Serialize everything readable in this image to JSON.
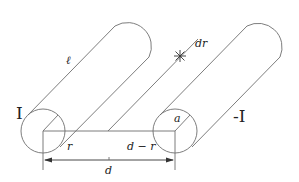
{
  "diagram": {
    "colors": {
      "line": "#6e6e6e",
      "text": "#222222",
      "background": "#ffffff"
    },
    "labels": {
      "length": "ℓ",
      "current_left": "I",
      "current_right": "-I",
      "radius": "a",
      "distance_r": "r",
      "distance_d_minus_r": "d − r",
      "separation": "d",
      "strip_width": "dr"
    },
    "conductors": [
      {
        "name": "left-conductor",
        "current_label": "I"
      },
      {
        "name": "right-conductor",
        "current_label": "-I"
      }
    ],
    "dimension": {
      "label": "d",
      "arrows": "both-ends"
    }
  }
}
